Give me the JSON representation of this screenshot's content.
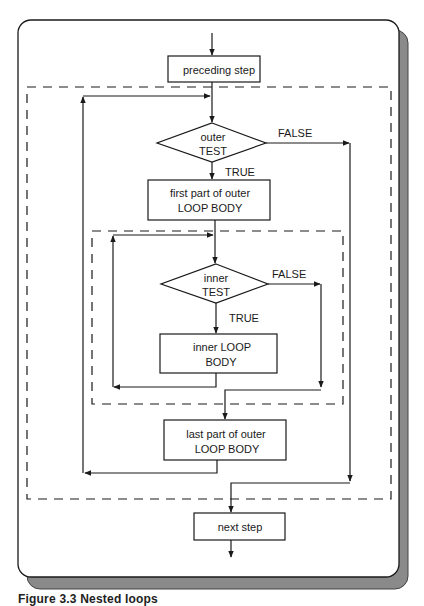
{
  "figure": {
    "caption": "Figure 3.3 Nested loops",
    "colors": {
      "line": "#1a1a1a",
      "shadow": "#8a8a8a",
      "background": "#ffffff"
    }
  },
  "nodes": {
    "preceding_step": {
      "label": "preceding step"
    },
    "outer_test": {
      "line1": "outer",
      "line2": "TEST"
    },
    "first_part": {
      "line1": "first part of outer",
      "line2": "LOOP BODY"
    },
    "inner_test": {
      "line1": "inner",
      "line2": "TEST"
    },
    "inner_body": {
      "line1": "inner LOOP",
      "line2": "BODY"
    },
    "last_part": {
      "line1": "last part of outer",
      "line2": "LOOP BODY"
    },
    "next_step": {
      "label": "next step"
    }
  },
  "edge_labels": {
    "outer_false": "FALSE",
    "outer_true": "TRUE",
    "inner_false": "FALSE",
    "inner_true": "TRUE"
  },
  "regions": {
    "outer_loop": "outer loop (dashed region)",
    "inner_loop": "inner loop (dashed region)"
  }
}
